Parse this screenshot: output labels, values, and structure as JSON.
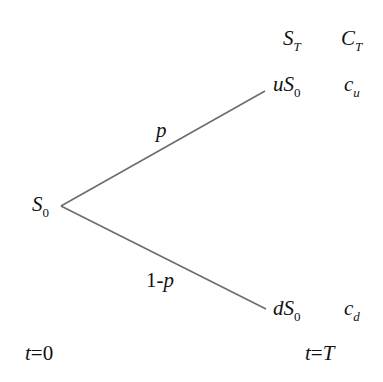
{
  "diagram": {
    "type": "binomial-tree",
    "headers": {
      "stock": {
        "main": "S",
        "sub": "T"
      },
      "option": {
        "main": "C",
        "sub": "T"
      }
    },
    "root": {
      "main": "S",
      "sub": "0"
    },
    "up_node": {
      "prefix": "u",
      "main": "S",
      "sub": "0"
    },
    "down_node": {
      "prefix": "d",
      "main": "S",
      "sub": "0"
    },
    "up_payoff": {
      "main": "c",
      "sub": "u"
    },
    "down_payoff": {
      "main": "c",
      "sub": "d"
    },
    "up_prob": "p",
    "down_prob_prefix": "1-",
    "down_prob_var": "p",
    "time_start": {
      "var": "t",
      "eq": "=",
      "val": "0"
    },
    "time_end": {
      "var": "t",
      "eq": "=",
      "val": "T"
    },
    "line_color": "#6b6b6b"
  }
}
